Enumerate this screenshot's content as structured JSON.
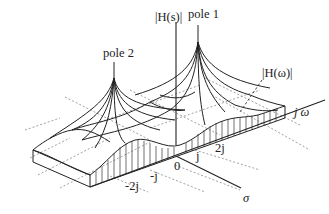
{
  "figure": {
    "labels": {
      "hs": "|H(s)|",
      "pole1": "pole 1",
      "pole2": "pole 2",
      "hw": "|H(ω)|",
      "jw_axis": "j ω",
      "sigma_axis": "σ",
      "origin": "0"
    },
    "jw_ticks": [
      "-2j",
      "-j",
      "j",
      "2j"
    ],
    "colors": {
      "ink": "#222222",
      "grid": "#888888",
      "background": "#ffffff"
    }
  }
}
